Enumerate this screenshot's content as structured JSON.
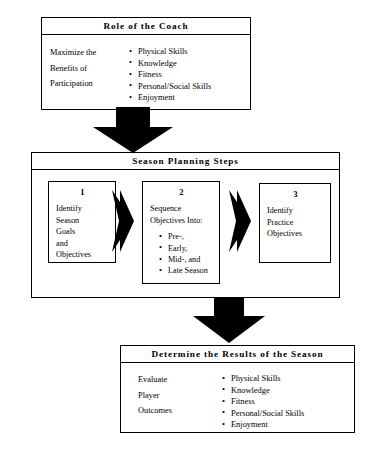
{
  "top_panel": {
    "title": "Role of the Coach",
    "left_label": "Maximize the\nBenefits of\nParticipation",
    "bullets": [
      "Physical Skills",
      "Knowledge",
      "Fitness",
      "Personal/Social Skills",
      "Enjoyment"
    ]
  },
  "middle_panel": {
    "title": "Season Planning Steps",
    "steps": [
      {
        "number": "1",
        "text": "Identify\nSeason\nGoals\nand\nObjectives",
        "bullets": []
      },
      {
        "number": "2",
        "text": "Sequence\nObjectives Into:",
        "bullets": [
          "Pre-,",
          "Early,",
          "Mid-, and",
          "Late Season"
        ]
      },
      {
        "number": "3",
        "text": "Identify\nPractice\nObjectives",
        "bullets": []
      }
    ]
  },
  "bottom_panel": {
    "title": "Determine the Results of the Season",
    "left_label": "Evaluate\nPlayer\nOutcomes",
    "bullets": [
      "Physical Skills",
      "Knowledge",
      "Fitness",
      "Personal/Social Skills",
      "Enjoyment"
    ]
  },
  "arrows": {
    "down_1": "arrow-down-icon",
    "down_2": "arrow-down-icon",
    "right_1": "arrow-right-icon",
    "right_2": "arrow-right-icon"
  },
  "colors": {
    "stroke": "#000000",
    "fill": "#ffffff",
    "arrow": "#000000"
  }
}
